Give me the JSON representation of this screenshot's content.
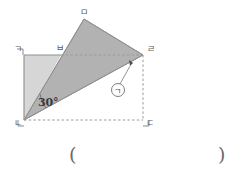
{
  "figure": {
    "type": "geometry-diagram",
    "labels": {
      "top_left": "ㄱ",
      "bottom_left": "ㄴ",
      "bottom_right": "ㄷ",
      "right": "ㄹ",
      "apex": "ㅁ",
      "top_mid": "ㅂ"
    },
    "angle_label": "30°",
    "unknown_marker": "ㄱ",
    "colors": {
      "light_triangle_fill": "#d3d3d3",
      "dark_triangle_fill": "#b0b0b0",
      "outline": "#8a8a8a",
      "dashed": "#9a9a9a",
      "label_text": "#5a5a5a",
      "angle_text": "#3a3a3a",
      "background": "#ffffff"
    },
    "points": {
      "ㄱ": [
        24,
        55
      ],
      "ㄴ": [
        24,
        120
      ],
      "ㄷ": [
        143,
        120
      ],
      "ㄹ": [
        143,
        55
      ],
      "ㅁ": [
        84,
        19
      ],
      "ㅂ": [
        61,
        55
      ]
    }
  },
  "answer": {
    "open_paren": "(",
    "close_paren": ")",
    "value": ""
  }
}
